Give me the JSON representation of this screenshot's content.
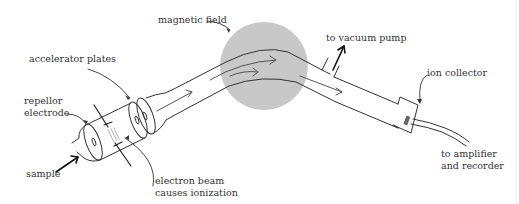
{
  "diagram": {
    "labels": {
      "magnetic_field": "magnetic field",
      "accelerator_plates": "accelerator plates",
      "repellor_line1": "repellor",
      "repellor_line2": "electrode",
      "sample": "sample",
      "electron_beam_line1": "electron beam",
      "electron_beam_line2": "causes ionization",
      "vacuum_pump": "to vacuum pump",
      "ion_collector": "ion collector",
      "amplifier_line1": "to amplifier",
      "amplifier_line2": "and recorder"
    },
    "colors": {
      "magnet_fill": "#c8c8c8",
      "line": "#333333",
      "collector": "#666666"
    }
  }
}
